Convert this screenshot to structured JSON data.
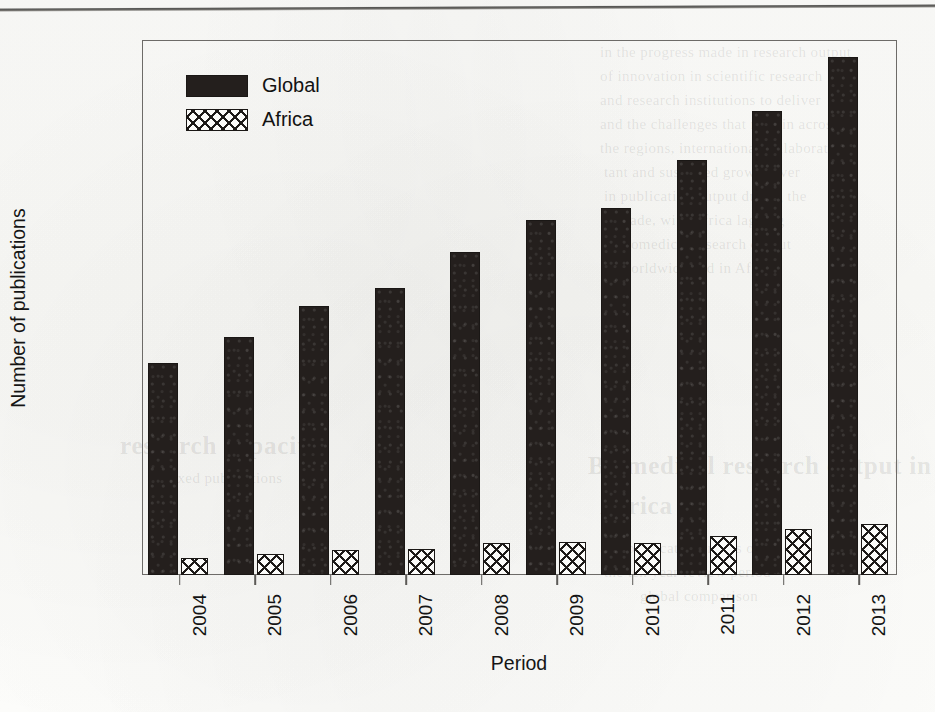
{
  "chart_data": {
    "type": "bar",
    "title": "",
    "xlabel": "Period",
    "ylabel": "Number of publications",
    "categories": [
      "2004",
      "2005",
      "2006",
      "2007",
      "2008",
      "2009",
      "2010",
      "2011",
      "2012",
      "2013"
    ],
    "series": [
      {
        "name": "Global",
        "values": [
          9900,
          11100,
          12550,
          13400,
          15100,
          16600,
          17150,
          19400,
          21700,
          24200
        ]
      },
      {
        "name": "Africa",
        "values": [
          800,
          1000,
          1150,
          1200,
          1500,
          1550,
          1480,
          1800,
          2150,
          2400
        ]
      }
    ],
    "ylim": [
      0,
      25000
    ],
    "yticks": [
      0,
      2000,
      4000,
      6000,
      8000,
      10000,
      12000,
      14000,
      16000,
      18000,
      20000,
      22000,
      24000
    ],
    "ytick_labels": [
      "0",
      "2000",
      "4000",
      "6000",
      "8000",
      "10000",
      "12000",
      "14000",
      "16000",
      "18000",
      "20000",
      "22000",
      "24000"
    ],
    "grid": false,
    "legend_position": "top-left",
    "legend": [
      "Global",
      "Africa"
    ],
    "colors": {
      "Global": "#241f1d",
      "Africa": "#1d1a18",
      "axis": "#6d6b68",
      "text": "#141414"
    }
  },
  "ghost_text": {
    "note": "faint bleed-through from reverse of scanned page, illegible",
    "blocks": [
      {
        "text": "in the progress made in research output",
        "x": 600,
        "y": 44,
        "kind": "body"
      },
      {
        "text": "of innovation in scientific research",
        "x": 600,
        "y": 68,
        "kind": "body"
      },
      {
        "text": "and research institutions to deliver",
        "x": 600,
        "y": 92,
        "kind": "body"
      },
      {
        "text": "and the challenges that remain across",
        "x": 600,
        "y": 116,
        "kind": "body"
      },
      {
        "text": "the regions, international collaboration",
        "x": 600,
        "y": 140,
        "kind": "body"
      },
      {
        "text": "tant and sustained growth over",
        "x": 604,
        "y": 164,
        "kind": "body"
      },
      {
        "text": "in publication output during the",
        "x": 604,
        "y": 188,
        "kind": "body"
      },
      {
        "text": "decade, with Africa lagging",
        "x": 608,
        "y": 212,
        "kind": "body"
      },
      {
        "text": "Biomedical research output",
        "x": 616,
        "y": 236,
        "kind": "body"
      },
      {
        "text": "worldwide and in Africa",
        "x": 620,
        "y": 260,
        "kind": "body"
      },
      {
        "text": "Biomedical research output in",
        "x": 588,
        "y": 452,
        "kind": "head"
      },
      {
        "text": "Africa",
        "x": 600,
        "y": 492,
        "kind": "head"
      },
      {
        "text": "and publication trends over",
        "x": 600,
        "y": 540,
        "kind": "body"
      },
      {
        "text": "the ten year review period",
        "x": 604,
        "y": 564,
        "kind": "body"
      },
      {
        "text": "global comparison",
        "x": 640,
        "y": 588,
        "kind": "body"
      },
      {
        "text": "research capacity",
        "x": 120,
        "y": 432,
        "kind": "head"
      },
      {
        "text": "indexed publications",
        "x": 150,
        "y": 470,
        "kind": "body"
      }
    ]
  }
}
